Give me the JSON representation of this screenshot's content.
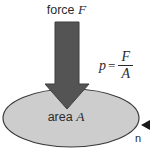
{
  "diagram": {
    "background_color": "#ffffff",
    "force_label": {
      "text": "force ",
      "symbol": "F"
    },
    "area_label": {
      "text": "area ",
      "symbol": "A"
    },
    "formula": {
      "variable": "p",
      "equals": "=",
      "numerator": "F",
      "denominator": "A"
    },
    "callout": {
      "marker": "left-triangle",
      "text": "n"
    },
    "colors": {
      "arrow_fill": "#545454",
      "arrow_stroke": "#3d3d3d",
      "ellipse_fill": "#cdcdcd",
      "ellipse_stroke": "#3a3a3a",
      "text": "#2b2b2b",
      "marker": "#1a1a1a"
    },
    "shapes": {
      "ellipse": {
        "cx": 71,
        "cy": 118,
        "rx": 68,
        "ry": 29
      },
      "arrow": {
        "shaft_left": 55,
        "shaft_right": 79,
        "shaft_top": 22,
        "head_left": 45,
        "head_right": 89,
        "head_top": 84,
        "tip_y": 109
      },
      "marker_triangle": {
        "x": 150,
        "y": 125,
        "size": 9
      }
    }
  }
}
